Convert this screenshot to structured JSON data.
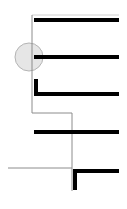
{
  "diagram": {
    "width": 127,
    "height": 209,
    "colors": {
      "background": "#ffffff",
      "thin_line": "#8c8c8c",
      "thick_bar": "#000000",
      "marker_fill": "#e6e6e6",
      "marker_stroke": "#b4b4b4"
    },
    "thin_path": "M32 15 L32 113 L72 113 L72 191",
    "thin_horizontal": {
      "x1": 8,
      "y1": 168,
      "x2": 72,
      "y2": 168
    },
    "thin_top_stub": {
      "x1": 32,
      "y1": 15,
      "x2": 119,
      "y2": 15
    },
    "bars": [
      {
        "id": "bar-1",
        "path": "M34 20 L119 20"
      },
      {
        "id": "bar-2",
        "path": "M34 57 L119 57"
      },
      {
        "id": "bar-3",
        "path": "M36 79 L36 94 L119 94"
      },
      {
        "id": "bar-4",
        "path": "M34 132 L119 132"
      },
      {
        "id": "bar-5",
        "path": "M75 190 L75 171 L119 171"
      }
    ],
    "marker": {
      "cx": 29,
      "cy": 57,
      "r": 14
    }
  }
}
